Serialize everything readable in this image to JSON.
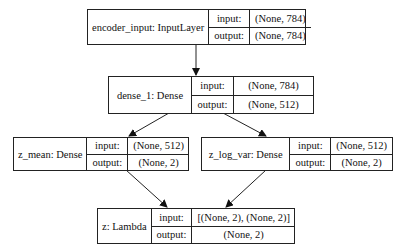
{
  "nodes": [
    {
      "id": "encoder_input",
      "name": "encoder_input: InputLayer",
      "input_label": "input:",
      "output_label": "output:",
      "input": "(None, 784)",
      "output": "(None, 784)"
    },
    {
      "id": "dense_1",
      "name": "dense_1: Dense",
      "input_label": "input:",
      "output_label": "output:",
      "input": "(None, 784)",
      "output": "(None, 512)"
    },
    {
      "id": "z_mean",
      "name": "z_mean: Dense",
      "input_label": "input:",
      "output_label": "output:",
      "input": "(None, 512)",
      "output": "(None, 2)"
    },
    {
      "id": "z_log_var",
      "name": "z_log_var: Dense",
      "input_label": "input:",
      "output_label": "output:",
      "input": "(None, 512)",
      "output": "(None, 2)"
    },
    {
      "id": "z",
      "name": "z: Lambda",
      "input_label": "input:",
      "output_label": "output:",
      "input": "[(None, 2), (None, 2)]",
      "output": "(None, 2)"
    }
  ],
  "edges": [
    {
      "from": "encoder_input",
      "to": "dense_1"
    },
    {
      "from": "dense_1",
      "to": "z_mean"
    },
    {
      "from": "dense_1",
      "to": "z_log_var"
    },
    {
      "from": "z_mean",
      "to": "z"
    },
    {
      "from": "z_log_var",
      "to": "z"
    }
  ]
}
